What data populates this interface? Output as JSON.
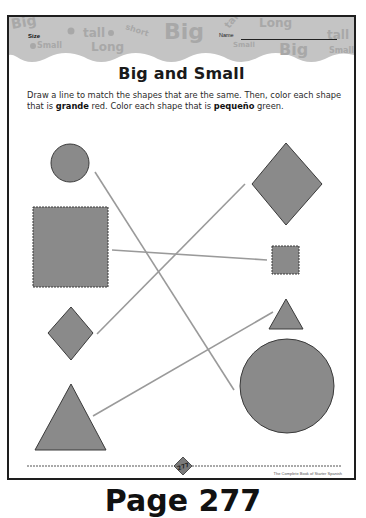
{
  "worksheet": {
    "header": {
      "size_label": "Size",
      "name_label": "Name",
      "background_words": [
        "Big",
        "tall",
        "short",
        "Big",
        "Long",
        "tall",
        "Small",
        "Long",
        "Big",
        "Small"
      ]
    },
    "title": "Big and Small",
    "instructions": {
      "part1": "Draw a line to match the shapes that are the same. Then, color each shape that is ",
      "word_grande": "grande",
      "part2": " red. Color each shape that is ",
      "word_pequeno": "pequeño",
      "part3": " green."
    },
    "shapes": {
      "left": [
        {
          "id": "small-circle",
          "type": "circle",
          "size": "small"
        },
        {
          "id": "big-square",
          "type": "square",
          "size": "big"
        },
        {
          "id": "small-diamond",
          "type": "diamond",
          "size": "small"
        },
        {
          "id": "big-triangle",
          "type": "triangle",
          "size": "big"
        }
      ],
      "right": [
        {
          "id": "big-diamond",
          "type": "diamond",
          "size": "big"
        },
        {
          "id": "small-square",
          "type": "square",
          "size": "small"
        },
        {
          "id": "small-triangle",
          "type": "triangle",
          "size": "small"
        },
        {
          "id": "big-circle",
          "type": "circle",
          "size": "big"
        }
      ]
    },
    "matching_lines": [
      {
        "from": "small-circle",
        "to": "big-circle"
      },
      {
        "from": "big-square",
        "to": "small-square"
      },
      {
        "from": "small-diamond",
        "to": "big-diamond"
      },
      {
        "from": "big-triangle",
        "to": "small-triangle"
      }
    ],
    "footer": {
      "page_number": "277",
      "credit": "The Complete Book of Starter Spanish"
    },
    "colors": {
      "shape_fill": "#8a8a8a",
      "shape_stroke": "#3a3a3a",
      "line": "#9a9a9a",
      "header_band": "#c4c4c4"
    }
  },
  "caption": "Page 277"
}
